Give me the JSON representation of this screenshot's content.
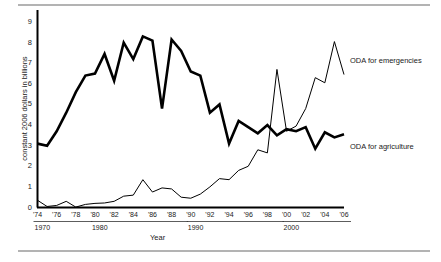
{
  "figure": {
    "y_axis_title": "constant 2006 dollars in billions",
    "x_axis_title": "Year"
  },
  "labels": {
    "emergencies": "ODA for emergencies",
    "agriculture": "ODA for agriculture"
  },
  "chart_data": {
    "type": "line",
    "title": "",
    "xlabel": "Year",
    "ylabel": "constant 2006 dollars in billions",
    "xlim": [
      1974,
      2006
    ],
    "ylim": [
      0,
      9.6
    ],
    "grid": false,
    "legend": "inline-right",
    "y_ticks": [
      0,
      1,
      2,
      3,
      4,
      5,
      6,
      7,
      8,
      9
    ],
    "x_ticks": [
      1974,
      1976,
      1978,
      1980,
      1982,
      1984,
      1986,
      1988,
      1990,
      1992,
      1994,
      1996,
      1998,
      2000,
      2002,
      2004,
      2006
    ],
    "x_tick_labels": [
      "'74",
      "'76",
      "'78",
      "'80",
      "'82",
      "'84",
      "'86",
      "'88",
      "'90",
      "'92",
      "'94",
      "'96",
      "'98",
      "'00",
      "'02",
      "'04",
      "'06"
    ],
    "decade_labels": [
      {
        "text": "1970",
        "year": 1974,
        "span_end": 1979
      },
      {
        "text": "1980",
        "year": 1980,
        "span_end": 1989
      },
      {
        "text": "1990",
        "year": 1990,
        "span_end": 1999
      },
      {
        "text": "2000",
        "year": 2000,
        "span_end": 2006
      }
    ],
    "x": [
      1974,
      1975,
      1976,
      1977,
      1978,
      1979,
      1980,
      1981,
      1982,
      1983,
      1984,
      1985,
      1986,
      1987,
      1988,
      1989,
      1990,
      1991,
      1992,
      1993,
      1994,
      1995,
      1996,
      1997,
      1998,
      1999,
      2000,
      2001,
      2002,
      2003,
      2004,
      2005,
      2006
    ],
    "series": [
      {
        "name": "ODA for agriculture",
        "style": "thick",
        "color": "#000000",
        "values": [
          3.1,
          3.0,
          3.7,
          4.6,
          5.6,
          6.4,
          6.5,
          7.45,
          6.15,
          8.0,
          7.2,
          8.3,
          8.1,
          4.8,
          8.15,
          7.6,
          6.6,
          6.4,
          4.6,
          5.0,
          3.1,
          4.2,
          3.9,
          3.6,
          4.0,
          3.5,
          3.8,
          3.7,
          3.9,
          2.85,
          3.65,
          3.4,
          3.55
        ],
        "note_values_alignment": "thick black line, ODA for agriculture"
      },
      {
        "name": "ODA for emergencies",
        "style": "thin",
        "color": "#000000",
        "values": [
          0.35,
          0.05,
          0.1,
          0.3,
          0.02,
          0.15,
          0.2,
          0.22,
          0.3,
          0.55,
          0.6,
          1.35,
          0.75,
          0.95,
          0.9,
          0.5,
          0.45,
          0.65,
          1.0,
          1.4,
          1.35,
          1.8,
          2.0,
          2.8,
          2.65,
          6.7,
          3.7,
          3.95,
          4.8,
          6.3,
          6.05,
          8.05,
          6.45
        ],
        "note_values_alignment": "thin black line, ODA for emergencies"
      }
    ]
  }
}
